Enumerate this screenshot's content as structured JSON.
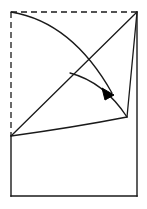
{
  "canvas": {
    "width": 147,
    "height": 209,
    "background_color": "#ffffff"
  },
  "figure": {
    "title": "",
    "stroke_color": "#1a1a1a",
    "fill_color": "#000000",
    "stroke_width": 1.3,
    "dash_pattern": "6 4"
  },
  "geometry": {
    "points": {
      "top_left": {
        "x": 11,
        "y": 12
      },
      "top_right": {
        "x": 137,
        "y": 12
      },
      "mid_left": {
        "x": 11,
        "y": 136
      },
      "bottom_left": {
        "x": 11,
        "y": 196
      },
      "bottom_right": {
        "x": 137,
        "y": 196
      },
      "diagonal_branch": {
        "x": 70,
        "y": 73
      },
      "right_notch": {
        "x": 127,
        "y": 117
      },
      "arrow_tip": {
        "x": 114,
        "y": 94
      }
    },
    "paths": {
      "dashed_left_edge": "M 11 12 L 11 136",
      "dashed_top_edge": "M 11 12 L 137 12",
      "solid_left_edge": "M 11 136 L 11 196",
      "solid_bottom_edge": "M 11 196 L 137 196",
      "solid_right_edge": "M 137 196 L 137 12",
      "main_diagonal": "M 11 136 L 137 12",
      "upper_arc": "M 11 12 Q 72 22 112 93",
      "middle_arc": "M 70 73 Q 104 82 127 117",
      "lower_arc": "M 11 136 Q 76 127 127 117",
      "notch_riser": "M 127 117 L 137 12",
      "arrowhead": "M 114 95 L 102 88 L 105 100 Z"
    }
  },
  "elements": [
    {
      "name": "dashed-left-edge",
      "style": "dashed"
    },
    {
      "name": "dashed-top-edge",
      "style": "dashed"
    },
    {
      "name": "solid-left-edge",
      "style": "solid"
    },
    {
      "name": "solid-bottom-edge",
      "style": "solid"
    },
    {
      "name": "solid-right-edge",
      "style": "solid"
    },
    {
      "name": "main-diagonal",
      "style": "solid"
    },
    {
      "name": "upper-arc",
      "style": "solid"
    },
    {
      "name": "middle-arc",
      "style": "solid"
    },
    {
      "name": "lower-arc",
      "style": "solid"
    },
    {
      "name": "notch-riser",
      "style": "solid"
    },
    {
      "name": "arrowhead",
      "style": "filled"
    }
  ]
}
